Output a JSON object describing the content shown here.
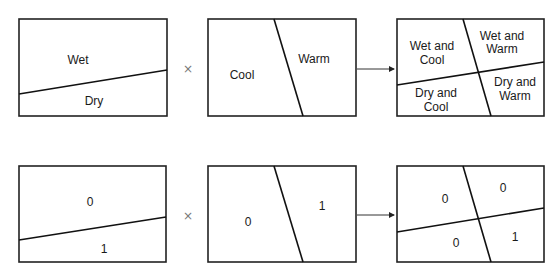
{
  "colors": {
    "stroke": "#222222",
    "text": "#1a1a1a",
    "operator": "#777777"
  },
  "operators": {
    "multiply": "×"
  },
  "rows": [
    {
      "name": "labels",
      "panel1": {
        "top": "Wet",
        "bottom": "Dry"
      },
      "panel2": {
        "left": "Cool",
        "right": "Warm"
      },
      "panel3": {
        "top_left": [
          "Wet and",
          "Cool"
        ],
        "top_right": [
          "Wet and",
          "Warm"
        ],
        "bottom_left": [
          "Dry and",
          "Cool"
        ],
        "bottom_right": [
          "Dry and",
          "Warm"
        ]
      }
    },
    {
      "name": "binary",
      "panel1": {
        "top": "0",
        "bottom": "1"
      },
      "panel2": {
        "left": "0",
        "right": "1"
      },
      "panel3": {
        "top_left": "0",
        "top_right": "0",
        "bottom_left": "0",
        "bottom_right": "1"
      }
    }
  ]
}
